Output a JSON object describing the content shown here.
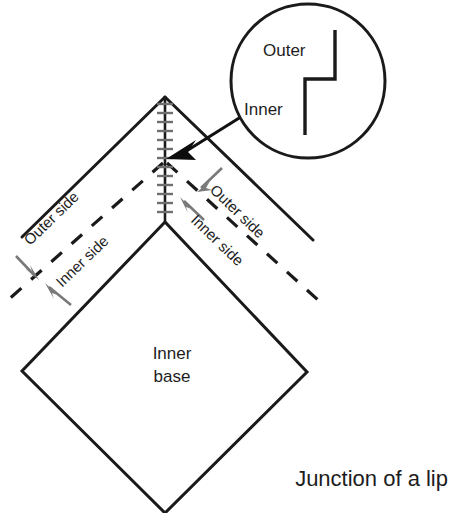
{
  "figure": {
    "caption": "Junction of a lip",
    "base_label_line1": "Inner",
    "base_label_line2": "base"
  },
  "inset": {
    "name": "magnified-detail-circle",
    "outer_label": "Outer",
    "inner_label": "Inner"
  },
  "labels": {
    "left_outer_side": "Outer side",
    "left_inner_side": "Inner side",
    "right_outer_side": "Outer side",
    "right_inner_side": "Inner side"
  },
  "colors": {
    "line": "#1a1a1a",
    "arrow_gray": "#7a7a7a",
    "arrow_black": "#0d0d0d",
    "hatch_tick": "#6f6f6f",
    "background": "#ffffff",
    "text": "#1d1d1d"
  },
  "geometry": {
    "canvas_width": 454,
    "canvas_height": 513,
    "apex": [
      165,
      97
    ],
    "center": [
      165,
      222
    ],
    "diamond_left": [
      22,
      371
    ],
    "diamond_bottom": [
      165,
      513
    ],
    "diamond_right": [
      307,
      372
    ],
    "inset_circle_center": [
      308,
      81
    ],
    "inset_circle_radius": 78
  }
}
